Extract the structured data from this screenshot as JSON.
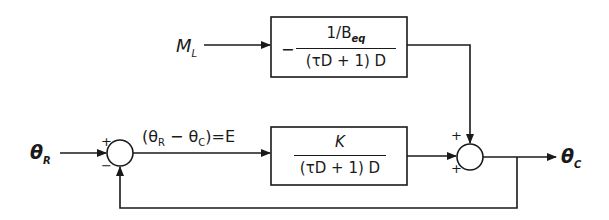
{
  "diagram": {
    "type": "block-diagram",
    "signals": {
      "reference_input": {
        "symbol": "θ",
        "subscript": "R"
      },
      "load_input": {
        "symbol": "M",
        "subscript": "L"
      },
      "output": {
        "symbol": "θ",
        "subscript": "C"
      },
      "error": {
        "text": "(θ",
        "sub1": "R",
        "mid": " − θ",
        "sub2": "C",
        "tail": ")=E"
      }
    },
    "blocks": [
      {
        "id": "disturbance-block",
        "sign": "−",
        "numerator": {
          "text": "1/B",
          "subscript": "eq"
        },
        "denominator": "(τD + 1) D"
      },
      {
        "id": "forward-block",
        "numerator": {
          "text": "K"
        },
        "denominator": "(τD + 1) D"
      }
    ],
    "summing_junctions": [
      {
        "id": "error-summer",
        "signs": {
          "top_left": "+",
          "bottom_left": "−"
        }
      },
      {
        "id": "output-summer",
        "signs": {
          "top_left": "+",
          "bottom_left": "+"
        }
      }
    ],
    "colors": {
      "line": "#1a1a1a",
      "background": "#ffffff"
    }
  }
}
